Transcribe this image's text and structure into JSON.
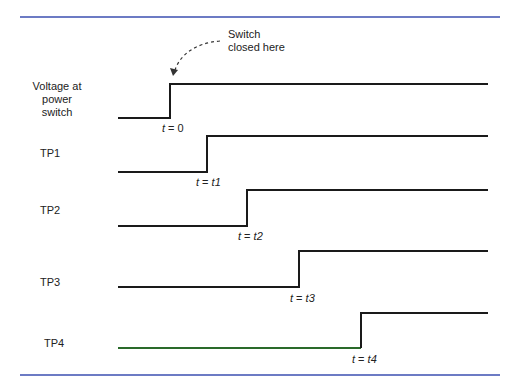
{
  "annotation": {
    "line1": "Switch",
    "line2": "closed here"
  },
  "rule_color": "#3b4fb0",
  "signals": [
    {
      "label_lines": [
        "Voltage at",
        "power",
        "switch"
      ],
      "time_var": "t",
      "time_val": "0",
      "color": "#1a1a1a"
    },
    {
      "label_lines": [
        "TP1"
      ],
      "time_var": "t",
      "time_val": "t1",
      "color": "#1a1a1a"
    },
    {
      "label_lines": [
        "TP2"
      ],
      "time_var": "t",
      "time_val": "t2",
      "color": "#1a1a1a"
    },
    {
      "label_lines": [
        "TP3"
      ],
      "time_var": "t",
      "time_val": "t3",
      "color": "#1a1a1a"
    },
    {
      "label_lines": [
        "TP4"
      ],
      "time_var": "t",
      "time_val": "t4",
      "color": "#2a6a2a"
    }
  ]
}
